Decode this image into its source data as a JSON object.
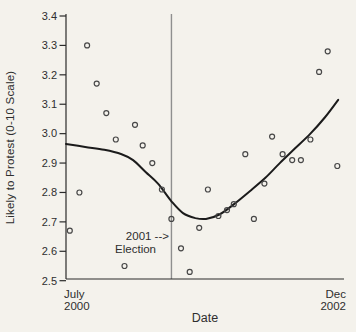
{
  "window": {
    "width": 356,
    "height": 332
  },
  "colors": {
    "background": "#f4f2ec",
    "axis": "#2a2a2a",
    "text": "#2e2e2e",
    "curve": "#1b1b1b",
    "point_stroke": "#474747",
    "election_line": "#8f8f8f"
  },
  "chart_data": {
    "type": "scatter",
    "title": "",
    "xlabel": "Date",
    "ylabel": "Likely to Protest (0-10 Scale)",
    "legend": "none",
    "grid": false,
    "x_axis": {
      "start_label": [
        "July",
        "2000"
      ],
      "end_label": [
        "Dec",
        "2002"
      ],
      "range_months": [
        0,
        29
      ]
    },
    "y_axis": {
      "min": 2.5,
      "max": 3.4,
      "tick_step": 0.1,
      "tick_labels": [
        "2.5",
        "2.6",
        "2.7",
        "2.8",
        "2.9",
        "3.0",
        "3.1",
        "3.2",
        "3.3",
        "3.4"
      ]
    },
    "annotation": {
      "line1": "2001 -->",
      "line2": "Election",
      "month": 11
    },
    "points": [
      {
        "m": 0.4,
        "v": 2.67
      },
      {
        "m": 1.4,
        "v": 2.8
      },
      {
        "m": 2.2,
        "v": 3.3
      },
      {
        "m": 3.2,
        "v": 3.17
      },
      {
        "m": 4.2,
        "v": 3.07
      },
      {
        "m": 5.2,
        "v": 2.98
      },
      {
        "m": 6.1,
        "v": 2.55
      },
      {
        "m": 7.2,
        "v": 3.03
      },
      {
        "m": 8.0,
        "v": 2.96
      },
      {
        "m": 9.0,
        "v": 2.9
      },
      {
        "m": 10.0,
        "v": 2.81
      },
      {
        "m": 11.0,
        "v": 2.71
      },
      {
        "m": 12.0,
        "v": 2.61
      },
      {
        "m": 12.9,
        "v": 2.53
      },
      {
        "m": 13.9,
        "v": 2.68
      },
      {
        "m": 14.8,
        "v": 2.81
      },
      {
        "m": 15.9,
        "v": 2.72
      },
      {
        "m": 16.8,
        "v": 2.74
      },
      {
        "m": 17.5,
        "v": 2.76
      },
      {
        "m": 18.7,
        "v": 2.93
      },
      {
        "m": 19.6,
        "v": 2.71
      },
      {
        "m": 20.7,
        "v": 2.83
      },
      {
        "m": 21.5,
        "v": 2.99
      },
      {
        "m": 22.6,
        "v": 2.93
      },
      {
        "m": 23.6,
        "v": 2.91
      },
      {
        "m": 24.5,
        "v": 2.91
      },
      {
        "m": 25.5,
        "v": 2.98
      },
      {
        "m": 26.4,
        "v": 3.21
      },
      {
        "m": 27.3,
        "v": 3.28
      },
      {
        "m": 28.3,
        "v": 2.89
      }
    ],
    "lowess_curve": [
      {
        "m": 0.0,
        "v": 2.965
      },
      {
        "m": 2.0,
        "v": 2.955
      },
      {
        "m": 4.0,
        "v": 2.945
      },
      {
        "m": 5.8,
        "v": 2.93
      },
      {
        "m": 7.0,
        "v": 2.91
      },
      {
        "m": 8.3,
        "v": 2.87
      },
      {
        "m": 9.6,
        "v": 2.83
      },
      {
        "m": 11.0,
        "v": 2.77
      },
      {
        "m": 12.2,
        "v": 2.73
      },
      {
        "m": 13.5,
        "v": 2.713
      },
      {
        "m": 14.6,
        "v": 2.71
      },
      {
        "m": 16.0,
        "v": 2.725
      },
      {
        "m": 17.6,
        "v": 2.762
      },
      {
        "m": 19.2,
        "v": 2.805
      },
      {
        "m": 20.8,
        "v": 2.85
      },
      {
        "m": 22.3,
        "v": 2.9
      },
      {
        "m": 23.9,
        "v": 2.95
      },
      {
        "m": 25.5,
        "v": 3.0
      },
      {
        "m": 27.0,
        "v": 3.055
      },
      {
        "m": 28.4,
        "v": 3.115
      }
    ]
  }
}
